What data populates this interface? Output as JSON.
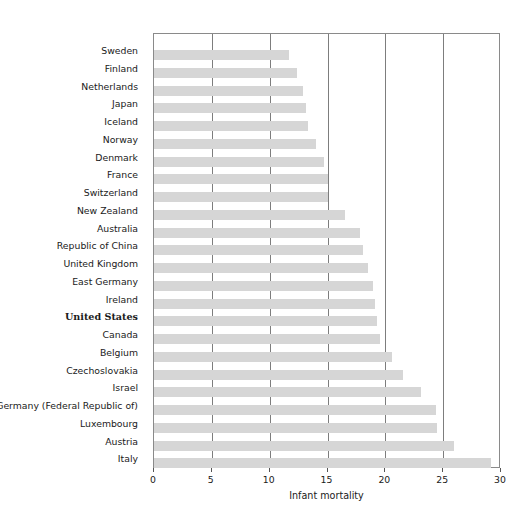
{
  "chart_data": {
    "type": "bar",
    "orientation": "horizontal",
    "title": "",
    "xlabel": "Infant mortality",
    "ylabel": "",
    "xlim": [
      0,
      30
    ],
    "xticks": [
      0,
      5,
      10,
      15,
      20,
      25,
      30
    ],
    "grid": true,
    "legend": "none",
    "bar_color": "#d6d6d6",
    "highlight_category": "United States",
    "categories": [
      "Sweden",
      "Finland",
      "Netherlands",
      "Japan",
      "Iceland",
      "Norway",
      "Denmark",
      "France",
      "Switzerland",
      "New Zealand",
      "Australia",
      "Republic of China",
      "United Kingdom",
      "East Germany",
      "Ireland",
      "United States",
      "Canada",
      "Belgium",
      "Czechoslovakia",
      "Israel",
      "Germany (Federal Republic of)",
      "Luxembourg",
      "Austria",
      "Italy"
    ],
    "values": [
      11.7,
      12.4,
      12.9,
      13.1,
      13.3,
      14.0,
      14.7,
      15.0,
      15.0,
      16.5,
      17.8,
      18.1,
      18.5,
      18.9,
      19.1,
      19.3,
      19.5,
      20.6,
      21.5,
      23.1,
      24.4,
      24.5,
      25.9,
      29.1
    ]
  }
}
